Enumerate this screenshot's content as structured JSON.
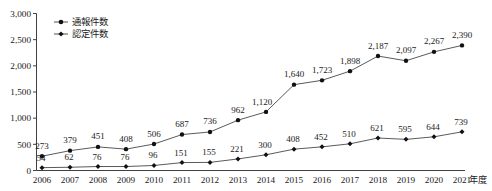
{
  "chart_data": {
    "type": "line",
    "title": "",
    "xlabel": "年度",
    "ylabel": "",
    "ylim": [
      0,
      3000
    ],
    "ytick_step": 500,
    "grid": false,
    "legend_position": "top-left",
    "categories": [
      "2006",
      "2007",
      "2008",
      "2009",
      "2010",
      "2011",
      "2012",
      "2013",
      "2014",
      "2015",
      "2016",
      "2017",
      "2018",
      "2019",
      "2020",
      "2021"
    ],
    "yticks": [
      "0",
      "500",
      "1,000",
      "1,500",
      "2,000",
      "2,500",
      "3,000"
    ],
    "series": [
      {
        "name": "通報件数",
        "marker": "circle",
        "values": [
          273,
          379,
          451,
          408,
          506,
          687,
          736,
          962,
          1120,
          1640,
          1723,
          1898,
          2187,
          2097,
          2267,
          2390
        ],
        "labels": [
          "273",
          "379",
          "451",
          "408",
          "506",
          "687",
          "736",
          "962",
          "1,120",
          "1,640",
          "1,723",
          "1,898",
          "2,187",
          "2,097",
          "2,267",
          "2,390"
        ]
      },
      {
        "name": "認定件数",
        "marker": "diamond",
        "values": [
          54,
          62,
          76,
          76,
          96,
          151,
          155,
          221,
          300,
          408,
          452,
          510,
          621,
          595,
          644,
          739
        ],
        "labels": [
          "54",
          "62",
          "76",
          "76",
          "96",
          "151",
          "155",
          "221",
          "300",
          "408",
          "452",
          "510",
          "621",
          "595",
          "644",
          "739"
        ]
      }
    ]
  },
  "colors": {
    "axis": "#2b2b2b",
    "line": "#3c3c3c",
    "marker": "#111111",
    "background": "#ffffff"
  }
}
